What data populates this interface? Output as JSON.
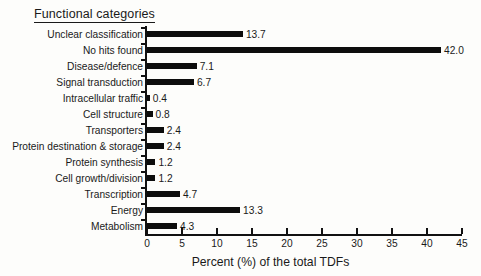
{
  "chart_data": {
    "type": "bar",
    "orientation": "horizontal",
    "title": "Functional categories",
    "xlabel": "Percent (%) of the total TDFs",
    "ylabel": "",
    "xlim": [
      0,
      45
    ],
    "xticks": [
      0,
      5,
      10,
      15,
      20,
      25,
      30,
      35,
      40,
      45
    ],
    "grid": false,
    "legend": null,
    "bar_color": "#0d0d0d",
    "categories": [
      "Unclear classification",
      "No hits found",
      "Disease/defence",
      "Signal transduction",
      "Intracellular traffic",
      "Cell structure",
      "Transporters",
      "Protein destination & storage",
      "Protein synthesis",
      "Cell growth/division",
      "Transcription",
      "Energy",
      "Metabolism"
    ],
    "values": [
      13.7,
      42.0,
      7.1,
      6.7,
      0.4,
      0.8,
      2.4,
      2.4,
      1.2,
      1.2,
      4.7,
      13.3,
      4.3
    ],
    "value_labels": [
      "13.7",
      "42.0",
      "7.1",
      "6.7",
      "0.4",
      "0.8",
      "2.4",
      "2.4",
      "1.2",
      "1.2",
      "4.7",
      "13.3",
      "4.3"
    ],
    "xtick_labels": [
      "0",
      "5",
      "10",
      "15",
      "20",
      "25",
      "30",
      "35",
      "40",
      "45"
    ]
  }
}
